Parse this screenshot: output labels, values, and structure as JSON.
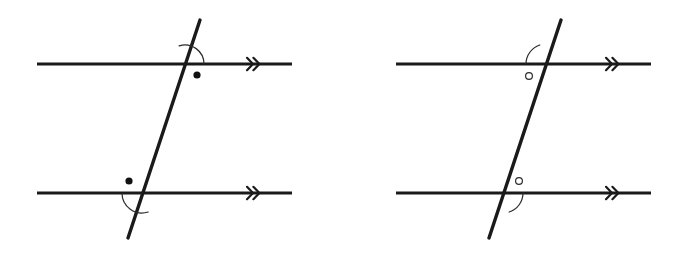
{
  "figure": {
    "title": "Parallel lines cut by a transversal — two marked angle pairs",
    "background_color": "#ffffff",
    "line_color": "#1a1a1a",
    "mark_color": "#2b2b2b",
    "width": 690,
    "height": 264
  },
  "diagrams": [
    {
      "id": "left-diagram",
      "name": "left-parallel-lines-diagram",
      "angle_mark_style": "filled-dot",
      "parallel_lines": [
        {
          "name": "upper-parallel-line",
          "x1": 37,
          "y1": 64,
          "x2": 292,
          "y2": 64,
          "arrow_mark": {
            "name": "double-chevron-mark",
            "count": 2,
            "x": 253,
            "y": 64,
            "direction": "right"
          }
        },
        {
          "name": "lower-parallel-line",
          "x1": 37,
          "y1": 193,
          "x2": 292,
          "y2": 193,
          "arrow_mark": {
            "name": "double-chevron-mark",
            "count": 2,
            "x": 253,
            "y": 193,
            "direction": "right"
          }
        }
      ],
      "transversal": {
        "name": "transversal-line",
        "x1": 128,
        "y1": 238,
        "x2": 200,
        "y2": 20
      },
      "intersections": [
        {
          "name": "upper-intersection",
          "x": 185,
          "y": 64
        },
        {
          "name": "lower-intersection",
          "x": 142,
          "y": 193
        }
      ],
      "angle_marks": [
        {
          "name": "upper-angle-mark",
          "marker": "filled-dot",
          "vertex_x": 185,
          "vertex_y": 64,
          "radius": 19,
          "start_angle_deg": 0,
          "end_angle_deg": 108,
          "dot_x": 197,
          "dot_y": 75,
          "dot_radius": 3.6,
          "position": "below-right",
          "description": "angle between transversal below-left and horizontal line to the right"
        },
        {
          "name": "lower-angle-mark",
          "marker": "filled-dot",
          "vertex_x": 142,
          "vertex_y": 193,
          "radius": 20,
          "start_angle_deg": 180,
          "end_angle_deg": 288,
          "dot_x": 129,
          "dot_y": 181,
          "dot_radius": 3.6,
          "position": "above-left",
          "description": "angle between horizontal line to the left and transversal above-right"
        }
      ]
    },
    {
      "id": "right-diagram",
      "name": "right-parallel-lines-diagram",
      "angle_mark_style": "hollow-circle",
      "parallel_lines": [
        {
          "name": "upper-parallel-line",
          "x1": 396,
          "y1": 64,
          "x2": 651,
          "y2": 64,
          "arrow_mark": {
            "name": "double-chevron-mark",
            "count": 2,
            "x": 612,
            "y": 64,
            "direction": "right"
          }
        },
        {
          "name": "lower-parallel-line",
          "x1": 396,
          "y1": 193,
          "x2": 651,
          "y2": 193,
          "arrow_mark": {
            "name": "double-chevron-mark",
            "count": 2,
            "x": 612,
            "y": 193,
            "direction": "right"
          }
        }
      ],
      "transversal": {
        "name": "transversal-line",
        "x1": 489,
        "y1": 238,
        "x2": 561,
        "y2": 20
      },
      "intersections": [
        {
          "name": "upper-intersection",
          "x": 546,
          "y": 64
        },
        {
          "name": "lower-intersection",
          "x": 503,
          "y": 193
        }
      ],
      "angle_marks": [
        {
          "name": "upper-angle-mark",
          "marker": "hollow-circle",
          "vertex_x": 546,
          "vertex_y": 64,
          "radius": 20,
          "start_angle_deg": 108,
          "end_angle_deg": 180,
          "dot_x": 529,
          "dot_y": 76,
          "dot_radius": 3.4,
          "position": "below-left",
          "description": "angle between horizontal line to the left and transversal below-left"
        },
        {
          "name": "lower-angle-mark",
          "marker": "hollow-circle",
          "vertex_x": 503,
          "vertex_y": 193,
          "radius": 20,
          "start_angle_deg": -72,
          "end_angle_deg": 0,
          "dot_x": 519,
          "dot_y": 181,
          "dot_radius": 3.4,
          "position": "above-right",
          "description": "angle between transversal above-right and horizontal line to the right"
        }
      ]
    }
  ]
}
